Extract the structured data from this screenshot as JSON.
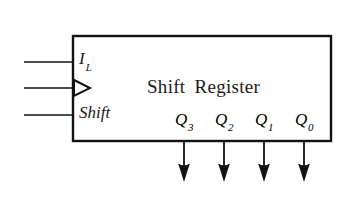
{
  "diagram": {
    "type": "logic-block-diagram",
    "title_words": [
      "Shift",
      "Register"
    ],
    "block": {
      "x": 73,
      "y": 36,
      "width": 258,
      "height": 105,
      "stroke": "#111111",
      "fill": "#ffffff",
      "stroke_width": 2.2
    },
    "inputs": [
      {
        "id": "il",
        "label": "I",
        "subscript": "L",
        "line_y": 62,
        "line_x_start": 24,
        "line_x_end": 73,
        "kind": "plain"
      },
      {
        "id": "clock",
        "label": "",
        "subscript": "",
        "line_y": 88,
        "line_x_start": 24,
        "line_x_end": 73,
        "kind": "clock-triangle"
      },
      {
        "id": "shift",
        "label": "Shift",
        "subscript": "",
        "line_y": 115,
        "line_x_start": 24,
        "line_x_end": 73,
        "kind": "plain"
      }
    ],
    "outputs": [
      {
        "id": "q3",
        "label": "Q",
        "subscript": "3",
        "x": 184,
        "arrow_y_start": 141,
        "arrow_y_end": 181
      },
      {
        "id": "q2",
        "label": "Q",
        "subscript": "2",
        "x": 224,
        "arrow_y_start": 141,
        "arrow_y_end": 181
      },
      {
        "id": "q1",
        "label": "Q",
        "subscript": "1",
        "x": 264,
        "arrow_y_start": 141,
        "arrow_y_end": 181
      },
      {
        "id": "q0",
        "label": "Q",
        "subscript": "0",
        "x": 304,
        "arrow_y_start": 141,
        "arrow_y_end": 181
      }
    ],
    "colors": {
      "background": "#ffffff",
      "line": "#111111",
      "text": "#1a1a1a"
    }
  }
}
